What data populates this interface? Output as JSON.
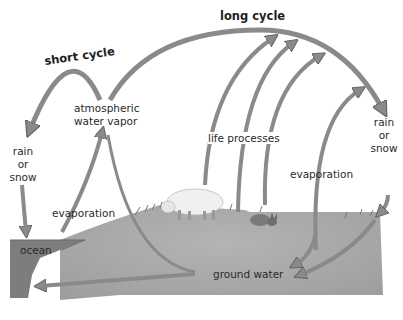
{
  "diagram": {
    "type": "water cycle",
    "cycles": {
      "short": "short cycle",
      "long": "long cycle"
    },
    "labels": {
      "atmospheric_line1": "atmospheric",
      "atmospheric_line2": "water vapor",
      "rain_left_1": "rain",
      "rain_left_2": "or",
      "rain_left_3": "snow",
      "rain_right_1": "rain",
      "rain_right_2": "or",
      "rain_right_3": "snow",
      "evaporation_left": "evaporation",
      "evaporation_right": "evaporation",
      "life_processes": "life processes",
      "ocean": "ocean",
      "ground_water": "ground water"
    },
    "illustrations": [
      "sheep",
      "rabbit",
      "grass",
      "ocean",
      "ground"
    ],
    "colors": {
      "arrow": "#8a8a8a",
      "arrow_edge": "#6a6a6a",
      "ground": "#a9a9a9",
      "ocean": "#7d7d7d",
      "text": "#2a2a2a"
    }
  }
}
